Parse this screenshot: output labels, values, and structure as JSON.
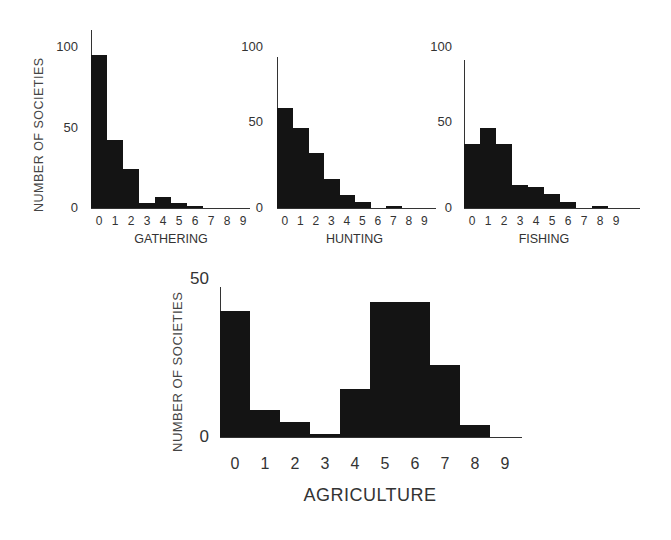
{
  "chart_data": [
    {
      "type": "bar",
      "title": "",
      "xlabel": "GATHERING",
      "ylabel": "NUMBER OF SOCIETIES",
      "categories": [
        "0",
        "1",
        "2",
        "3",
        "4",
        "5",
        "6",
        "7",
        "8",
        "9"
      ],
      "values": [
        95,
        42,
        24,
        3,
        7,
        3,
        1,
        0,
        0,
        0
      ],
      "ylim": [
        0,
        110
      ],
      "yticks": [
        "0",
        "50",
        "100"
      ],
      "grid": false
    },
    {
      "type": "bar",
      "title": "",
      "xlabel": "HUNTING",
      "ylabel": "",
      "categories": [
        "0",
        "1",
        "2",
        "3",
        "4",
        "5",
        "6",
        "7",
        "8",
        "9"
      ],
      "values": [
        62,
        50,
        34,
        18,
        8,
        4,
        0,
        1,
        0,
        0
      ],
      "ylim": [
        0,
        110
      ],
      "yticks": [
        "0",
        "50",
        "100"
      ],
      "grid": false
    },
    {
      "type": "bar",
      "title": "",
      "xlabel": "FISHING",
      "ylabel": "",
      "categories": [
        "0",
        "1",
        "2",
        "3",
        "4",
        "5",
        "6",
        "7",
        "8",
        "9"
      ],
      "values": [
        40,
        50,
        40,
        14,
        13,
        9,
        4,
        0,
        1,
        0
      ],
      "ylim": [
        0,
        110
      ],
      "yticks": [
        "0",
        "50",
        "100"
      ],
      "grid": false
    },
    {
      "type": "bar",
      "title": "",
      "xlabel": "AGRICULTURE",
      "ylabel": "NUMBER OF SOCIETIES",
      "categories": [
        "0",
        "1",
        "2",
        "3",
        "4",
        "5",
        "6",
        "7",
        "8",
        "9"
      ],
      "values": [
        42,
        9,
        5,
        1,
        16,
        45,
        45,
        24,
        4,
        0
      ],
      "ylim": [
        0,
        50
      ],
      "yticks": [
        "0",
        "50"
      ],
      "grid": false
    }
  ],
  "labels": {
    "ylabel": "NUMBER OF SOCIETIES",
    "gathering": "GATHERING",
    "hunting": "HUNTING",
    "fishing": "FISHING",
    "agriculture": "AGRICULTURE",
    "t0": "0",
    "t50": "50",
    "t100": "100"
  }
}
